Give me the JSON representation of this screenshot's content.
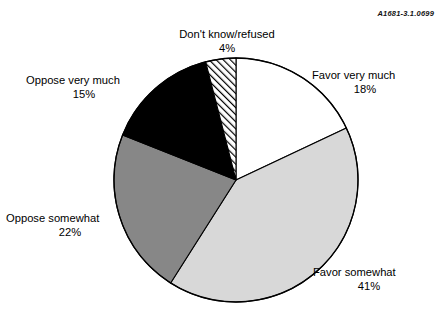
{
  "reference_code": "A1681-3.1.0699",
  "chart_data": {
    "type": "pie",
    "title": "",
    "subtitle": "",
    "xlabel": "",
    "ylabel": "",
    "legend_position": "none",
    "grid": false,
    "units": "percent",
    "start_angle_deg": 0,
    "direction": "clockwise",
    "center": {
      "x": 236,
      "y": 180
    },
    "radius": 122,
    "categories": [
      "Favor very much",
      "Favor somewhat",
      "Oppose somewhat",
      "Oppose very much",
      "Don't know/refused"
    ],
    "values": [
      18,
      41,
      22,
      15,
      4
    ],
    "slices": [
      {
        "label": "Favor very much",
        "value": 18,
        "value_text": "18%",
        "fill": "#ffffff",
        "pattern": "solid",
        "stroke": "#000000"
      },
      {
        "label": "Favor somewhat",
        "value": 41,
        "value_text": "41%",
        "fill": "#d8d8d8",
        "pattern": "solid",
        "stroke": "#000000"
      },
      {
        "label": "Oppose somewhat",
        "value": 22,
        "value_text": "22%",
        "fill": "#878787",
        "pattern": "solid",
        "stroke": "#000000"
      },
      {
        "label": "Oppose very much",
        "value": 15,
        "value_text": "15%",
        "fill": "#000000",
        "pattern": "solid",
        "stroke": "#000000"
      },
      {
        "label": "Don't know/refused",
        "value": 4,
        "value_text": "4%",
        "fill": "#ffffff",
        "pattern": "diagonal-hatch",
        "stroke": "#000000"
      }
    ]
  }
}
